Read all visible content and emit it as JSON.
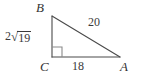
{
  "figure": {
    "background_color": "#ffffff",
    "stroke_color": "#4a4a4a",
    "text_color": "#3a3a3a"
  },
  "vertices": {
    "top": {
      "label": "B",
      "x": 52,
      "y": 16
    },
    "bottom_left": {
      "label": "C",
      "x": 52,
      "y": 57
    },
    "bottom_right": {
      "label": "A",
      "x": 120,
      "y": 57
    }
  },
  "sides": {
    "hypotenuse": {
      "label": "20",
      "from": "B",
      "to": "A"
    },
    "base": {
      "label": "18",
      "from": "C",
      "to": "A"
    },
    "left_leg": {
      "coefficient": "2",
      "radical_sign": "√",
      "radicand": "19",
      "full_label": "2√19",
      "from": "B",
      "to": "C"
    }
  },
  "right_angle": {
    "at_vertex": "C",
    "marker": "square",
    "size": 10
  }
}
